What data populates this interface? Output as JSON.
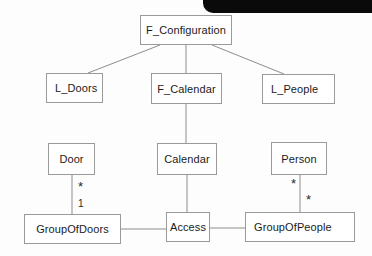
{
  "diagram": {
    "type": "uml-class-diagram",
    "background_color": "#fdfdfd",
    "box_border_color": "#9a9a9a",
    "edge_color": "#8d8d8d",
    "text_color": "#1b1b1b",
    "artifact_color": "#0a0a0a",
    "nodes": [
      {
        "id": "f_configuration",
        "label": "F_Configuration",
        "x": 140,
        "y": 15,
        "w": 92,
        "h": 30,
        "align": "center"
      },
      {
        "id": "l_doors",
        "label": "L_Doors",
        "x": 46,
        "y": 73,
        "w": 57,
        "h": 30,
        "align": "left"
      },
      {
        "id": "f_calendar",
        "label": "F_Calendar",
        "x": 151,
        "y": 73,
        "w": 71,
        "h": 31,
        "align": "center"
      },
      {
        "id": "l_people",
        "label": "L_People",
        "x": 262,
        "y": 74,
        "w": 73,
        "h": 30,
        "align": "left"
      },
      {
        "id": "door",
        "label": "Door",
        "x": 48,
        "y": 143,
        "w": 47,
        "h": 32,
        "align": "center"
      },
      {
        "id": "calendar",
        "label": "Calendar",
        "x": 157,
        "y": 143,
        "w": 60,
        "h": 32,
        "align": "center"
      },
      {
        "id": "person",
        "label": "Person",
        "x": 271,
        "y": 142,
        "w": 56,
        "h": 33,
        "align": "center"
      },
      {
        "id": "groupofdoors",
        "label": "GroupOfDoors",
        "x": 24,
        "y": 214,
        "w": 97,
        "h": 30,
        "align": "center"
      },
      {
        "id": "access",
        "label": "Access",
        "x": 166,
        "y": 212,
        "w": 44,
        "h": 30,
        "align": "center"
      },
      {
        "id": "groupofpeople",
        "label": "GroupOfPeople",
        "x": 245,
        "y": 212,
        "w": 110,
        "h": 30,
        "align": "left"
      }
    ],
    "edges": [
      {
        "id": "config-to-doors",
        "from": "f_configuration",
        "to": "l_doors",
        "x1": 160,
        "y1": 45,
        "x2": 88,
        "y2": 73
      },
      {
        "id": "config-to-calendar",
        "from": "f_configuration",
        "to": "f_calendar",
        "x1": 186,
        "y1": 45,
        "x2": 186,
        "y2": 73
      },
      {
        "id": "config-to-people",
        "from": "f_configuration",
        "to": "l_people",
        "x1": 212,
        "y1": 45,
        "x2": 284,
        "y2": 74
      },
      {
        "id": "calendar-down",
        "from": "f_calendar",
        "to": "calendar",
        "x1": 186,
        "y1": 104,
        "x2": 186,
        "y2": 143
      },
      {
        "id": "door-to-groupofdoors",
        "from": "door",
        "to": "groupofdoors",
        "x1": 72,
        "y1": 175,
        "x2": 72,
        "y2": 214
      },
      {
        "id": "calendar-to-access",
        "from": "calendar",
        "to": "access",
        "x1": 187,
        "y1": 175,
        "x2": 187,
        "y2": 212
      },
      {
        "id": "person-to-groupofpeople",
        "from": "person",
        "to": "groupofpeople",
        "x1": 300,
        "y1": 175,
        "x2": 300,
        "y2": 212
      },
      {
        "id": "groupofdoors-to-access",
        "from": "groupofdoors",
        "to": "access",
        "x1": 121,
        "y1": 229,
        "x2": 166,
        "y2": 229
      },
      {
        "id": "access-to-groupofpeople",
        "from": "access",
        "to": "groupofpeople",
        "x1": 210,
        "y1": 228,
        "x2": 245,
        "y2": 228
      }
    ],
    "multiplicities": [
      {
        "id": "door-many",
        "label": "*",
        "x": 78,
        "y": 180,
        "edge": "door-to-groupofdoors"
      },
      {
        "id": "groupofdoors-one",
        "label": "1",
        "x": 78,
        "y": 199,
        "edge": "door-to-groupofdoors"
      },
      {
        "id": "person-many",
        "label": "*",
        "x": 291,
        "y": 177,
        "edge": "person-to-groupofpeople"
      },
      {
        "id": "groupofpeople-many",
        "label": "*",
        "x": 306,
        "y": 193,
        "edge": "person-to-groupofpeople"
      }
    ],
    "artifact": {
      "id": "scan-edge-band",
      "x": 203,
      "y": 0,
      "w": 169,
      "h": 13
    }
  }
}
